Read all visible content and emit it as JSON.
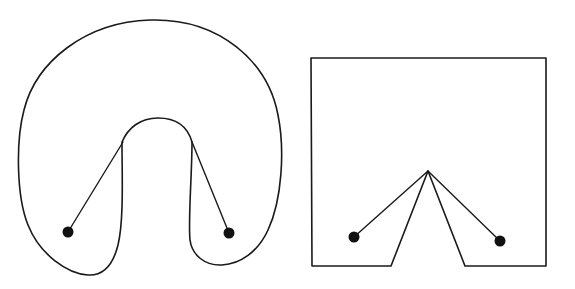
{
  "figure": {
    "panels": [
      {
        "id": "curved-region",
        "description": "Curved horseshoe-shaped region with two points whose connecting paths bend around the inner arch",
        "points": [
          {
            "name": "left-point",
            "x": 68,
            "y": 232
          },
          {
            "name": "right-point",
            "x": 229,
            "y": 233
          }
        ],
        "segments": [
          {
            "from": "left-point",
            "to": [
              123,
              142
            ]
          },
          {
            "from": "right-point",
            "to": [
              192,
              142
            ]
          }
        ]
      },
      {
        "id": "polygonal-region",
        "description": "Square region with a triangular notch cut from the bottom; two points connected via the notch apex",
        "points": [
          {
            "name": "left-point",
            "x": 354,
            "y": 237
          },
          {
            "name": "right-point",
            "x": 500,
            "y": 241
          },
          {
            "name": "notch-apex",
            "x": 428,
            "y": 171
          }
        ],
        "segments": [
          {
            "from": "left-point",
            "to": "notch-apex"
          },
          {
            "from": "right-point",
            "to": "notch-apex"
          }
        ]
      }
    ],
    "colors": {
      "stroke": "#1a1a1a",
      "dot": "#111111",
      "background": "#ffffff"
    }
  }
}
